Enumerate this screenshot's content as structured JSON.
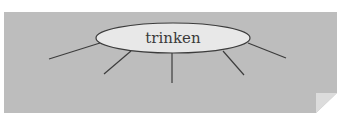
{
  "diagram": {
    "type": "word-web",
    "center_word": "trinken",
    "branch_count": 5,
    "branches": [
      {
        "x1": 100,
        "y1": 43,
        "x2": 49,
        "y2": 59
      },
      {
        "x1": 131,
        "y1": 51,
        "x2": 104,
        "y2": 74
      },
      {
        "x1": 172,
        "y1": 53,
        "x2": 172,
        "y2": 83
      },
      {
        "x1": 223,
        "y1": 51,
        "x2": 244,
        "y2": 75
      },
      {
        "x1": 248,
        "y1": 43,
        "x2": 286,
        "y2": 58
      }
    ],
    "colors": {
      "panel": "#bdbdbd",
      "ellipse_fill": "#e8e8e8",
      "stroke": "#3c3c3c",
      "page_curl": "#dcdcdc",
      "background": "#ffffff"
    }
  }
}
